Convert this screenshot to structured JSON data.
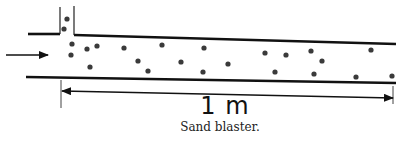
{
  "figure": {
    "caption": "Sand blaster.",
    "length_label": "1 m",
    "colors": {
      "line": "#111111",
      "particle": "#3a3a3a",
      "background": "#ffffff"
    },
    "pipe": {
      "top_left_segment": [
        [
          28,
          34
        ],
        [
          60,
          34
        ]
      ],
      "top_main_segment": [
        [
          74,
          35
        ],
        [
          396,
          44
        ]
      ],
      "bottom_segment": [
        [
          26,
          77
        ],
        [
          396,
          83
        ]
      ],
      "feed_tube_left": [
        [
          60,
          7
        ],
        [
          60,
          34
        ]
      ],
      "feed_tube_right": [
        [
          74,
          6
        ],
        [
          74,
          35
        ]
      ]
    },
    "inlet_arrow": {
      "from": [
        6,
        55
      ],
      "to": [
        48,
        55
      ]
    },
    "dimension": {
      "from": [
        62,
        91
      ],
      "to": [
        393,
        98
      ],
      "tick_left_x": 61,
      "tick_right_x": 393
    },
    "particles": [
      [
        67,
        19
      ],
      [
        64,
        29
      ],
      [
        72,
        44
      ],
      [
        71,
        55
      ],
      [
        87,
        49
      ],
      [
        97,
        46
      ],
      [
        90,
        67
      ],
      [
        124,
        48
      ],
      [
        162,
        45
      ],
      [
        138,
        61
      ],
      [
        148,
        71
      ],
      [
        181,
        62
      ],
      [
        204,
        48
      ],
      [
        203,
        72
      ],
      [
        228,
        64
      ],
      [
        265,
        53
      ],
      [
        286,
        55
      ],
      [
        311,
        51
      ],
      [
        322,
        61
      ],
      [
        275,
        72
      ],
      [
        314,
        74
      ],
      [
        371,
        50
      ],
      [
        356,
        77
      ],
      [
        392,
        76
      ]
    ]
  }
}
